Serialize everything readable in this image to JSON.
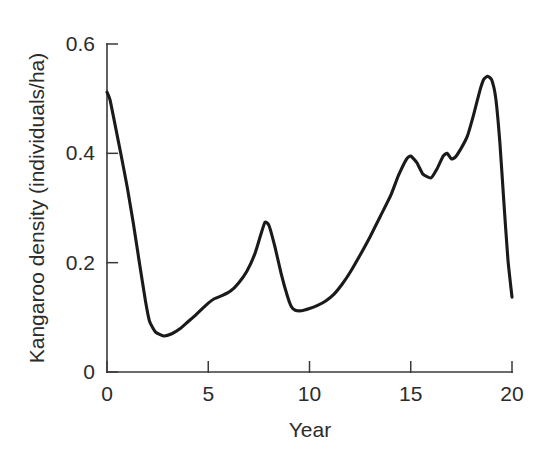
{
  "chart_data": {
    "type": "line",
    "title": "",
    "xlabel": "Year",
    "ylabel": "Kangaroo density (individuals/ha)",
    "xlim": [
      0,
      20
    ],
    "ylim": [
      0,
      0.6
    ],
    "xticks": [
      0,
      5,
      10,
      15,
      20
    ],
    "xtick_labels": [
      "0",
      "5",
      "10",
      "15",
      "20"
    ],
    "yticks": [
      0,
      0.2,
      0.4,
      0.6
    ],
    "ytick_labels": [
      "0",
      "0.2",
      "0.4",
      "0.6"
    ],
    "grid": false,
    "legend": null,
    "line_color": "#1a1a1a",
    "axis_color": "#3a3a3a",
    "background_color": "#ffffff",
    "series": [
      {
        "name": "Kangaroo density",
        "x": [
          0.0,
          0.15,
          0.4,
          0.7,
          1.0,
          1.3,
          1.6,
          1.9,
          2.1,
          2.4,
          2.8,
          3.2,
          3.6,
          4.0,
          4.4,
          4.8,
          5.0,
          5.3,
          5.7,
          6.1,
          6.5,
          6.9,
          7.3,
          7.6,
          7.8,
          8.0,
          8.3,
          8.6,
          8.9,
          9.1,
          9.3,
          9.6,
          10.0,
          10.4,
          10.8,
          11.2,
          11.6,
          12.0,
          12.5,
          13.0,
          13.5,
          14.0,
          14.4,
          14.8,
          15.0,
          15.3,
          15.6,
          16.0,
          16.3,
          16.6,
          16.8,
          17.0,
          17.2,
          17.5,
          17.8,
          18.1,
          18.4,
          18.6,
          18.8,
          19.0,
          19.2,
          19.4,
          19.6,
          19.8,
          20.0
        ],
        "y": [
          0.512,
          0.498,
          0.452,
          0.396,
          0.338,
          0.272,
          0.2,
          0.13,
          0.093,
          0.073,
          0.066,
          0.07,
          0.079,
          0.092,
          0.105,
          0.119,
          0.126,
          0.134,
          0.14,
          0.148,
          0.163,
          0.184,
          0.216,
          0.252,
          0.274,
          0.268,
          0.228,
          0.18,
          0.14,
          0.12,
          0.113,
          0.112,
          0.116,
          0.122,
          0.13,
          0.142,
          0.16,
          0.182,
          0.214,
          0.248,
          0.285,
          0.322,
          0.36,
          0.39,
          0.395,
          0.383,
          0.362,
          0.355,
          0.372,
          0.395,
          0.4,
          0.39,
          0.393,
          0.41,
          0.432,
          0.47,
          0.513,
          0.535,
          0.541,
          0.534,
          0.5,
          0.42,
          0.31,
          0.205,
          0.137
        ],
        "annotations": [
          {
            "label": "initial density",
            "x": 0.0,
            "y": 0.512
          },
          {
            "label": "first trough",
            "x": 2.8,
            "y": 0.066
          },
          {
            "label": "mid peak",
            "x": 7.8,
            "y": 0.274
          },
          {
            "label": "second trough",
            "x": 9.6,
            "y": 0.112
          },
          {
            "label": "local peak",
            "x": 15.0,
            "y": 0.395
          },
          {
            "label": "local dip",
            "x": 16.0,
            "y": 0.355
          },
          {
            "label": "maximum",
            "x": 18.8,
            "y": 0.541
          },
          {
            "label": "final density",
            "x": 20.0,
            "y": 0.137
          }
        ]
      }
    ]
  },
  "axes": {
    "y_axis_name": "y-axis",
    "x_axis_name": "x-axis"
  }
}
